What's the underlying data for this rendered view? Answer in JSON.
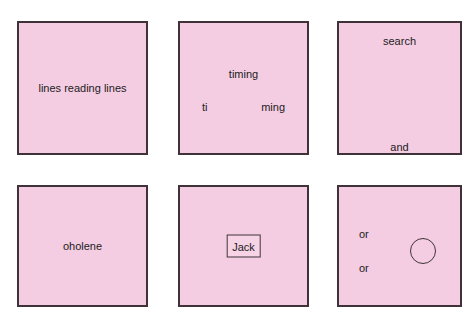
{
  "canvas": {
    "width": 475,
    "height": 328,
    "background_color": "#ffffff"
  },
  "style": {
    "panel_fill": "#f4cde2",
    "panel_border": "#3f3339",
    "text_color": "#1d1b1c"
  },
  "panels": [
    {
      "id": "panel-1",
      "position": "top-left",
      "labels": [
        {
          "text": "lines reading lines",
          "placement": "center"
        }
      ],
      "shapes": []
    },
    {
      "id": "panel-2",
      "position": "top-center",
      "labels": [
        {
          "text": "timing",
          "placement": "top-center"
        },
        {
          "text": "ti",
          "placement": "middle-left"
        },
        {
          "text": "ming",
          "placement": "middle-right"
        }
      ],
      "shapes": []
    },
    {
      "id": "panel-3",
      "position": "top-right",
      "labels": [
        {
          "text": "search",
          "placement": "top-center"
        },
        {
          "text": "and",
          "placement": "bottom-center"
        }
      ],
      "shapes": []
    },
    {
      "id": "panel-4",
      "position": "bottom-left",
      "labels": [
        {
          "text": "oholene",
          "placement": "center"
        }
      ],
      "shapes": []
    },
    {
      "id": "panel-5",
      "position": "bottom-center",
      "labels": [
        {
          "text": "Jack",
          "placement": "center",
          "boxed": true
        }
      ],
      "shapes": [
        {
          "type": "rectangle-outline",
          "around": "Jack"
        }
      ]
    },
    {
      "id": "panel-6",
      "position": "bottom-right",
      "labels": [
        {
          "text": "or",
          "placement": "upper-left"
        },
        {
          "text": "or",
          "placement": "lower-left"
        }
      ],
      "shapes": [
        {
          "type": "circle-outline",
          "placement": "middle-right"
        }
      ]
    }
  ],
  "text": {
    "lines_reading_lines": "lines reading lines",
    "timing": "timing",
    "ti": "ti",
    "ming": "ming",
    "search": "search",
    "and": "and",
    "oholene": "oholene",
    "jack": "Jack",
    "or_first": "or",
    "or_second": "or"
  }
}
